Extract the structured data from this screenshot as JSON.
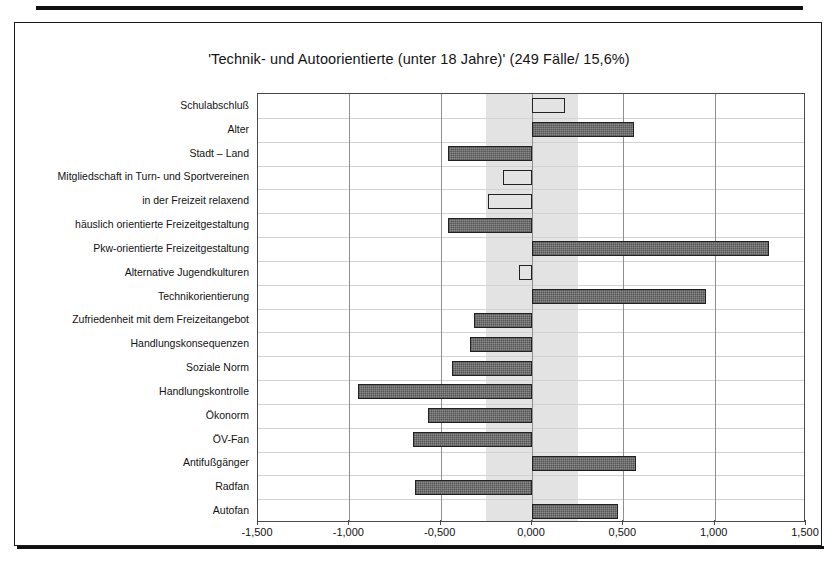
{
  "chart_title": "'Technik- und Autoorientierte (unter 18 Jahre)' (249 Fälle/ 15,6%)",
  "chart_data": {
    "type": "bar",
    "orientation": "horizontal",
    "title": "'Technik- und Autoorientierte (unter 18 Jahre)' (249 Fälle/ 15,6%)",
    "xlabel": "",
    "ylabel": "",
    "xlim": [
      -1.5,
      1.5
    ],
    "xticks": [
      -1.5,
      -1.0,
      -0.5,
      0.0,
      0.5,
      1.0,
      1.5
    ],
    "xticklabels": [
      "-1,500",
      "-1,000",
      "-0,500",
      "0,000",
      "0,500",
      "1,000",
      "1,500"
    ],
    "grid": "vertical-major-and-horizontal-row-separators",
    "legend": "none",
    "shaded_band": {
      "from": -0.25,
      "to": 0.25,
      "color": "#e3e3e3",
      "meaning": "nicht signifikanter Bereich"
    },
    "bar_styles": {
      "filled": "#8a8a8a",
      "open": "#ffffff",
      "border": "#222222"
    },
    "categories": [
      "Schulabschluß",
      "Alter",
      "Stadt – Land",
      "Mitgliedschaft in Turn- und Sportvereinen",
      "in der Freizeit relaxend",
      "häuslich orientierte Freizeitgestaltung",
      "Pkw-orientierte Freizeitgestaltung",
      "Alternative Jugendkulturen",
      "Technikorientierung",
      "Zufriedenheit mit dem Freizeitangebot",
      "Handlungskonsequenzen",
      "Soziale Norm",
      "Handlungskontrolle",
      "Ökonorm",
      "ÖV-Fan",
      "Antifußgänger",
      "Radfan",
      "Autofan"
    ],
    "values": [
      0.18,
      0.56,
      -0.46,
      -0.16,
      -0.24,
      -0.46,
      1.3,
      -0.07,
      0.95,
      -0.32,
      -0.34,
      -0.44,
      -0.95,
      -0.57,
      -0.65,
      0.57,
      -0.64,
      0.47
    ],
    "bar_fill": [
      "open",
      "filled",
      "filled",
      "open",
      "open",
      "filled",
      "filled",
      "open",
      "filled",
      "filled",
      "filled",
      "filled",
      "filled",
      "filled",
      "filled",
      "filled",
      "filled",
      "filled"
    ]
  }
}
